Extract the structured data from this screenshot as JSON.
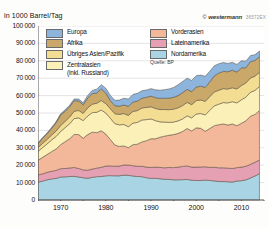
{
  "figure": {
    "axis_title": "in 1000 Barrel/Tag",
    "credit_symbol": "©",
    "credit_name": "westermann",
    "credit_code": "36572EX",
    "source": "Quelle: BP"
  },
  "legend": {
    "column_left": [
      {
        "label": "Europa",
        "color": "#8cb4dc"
      },
      {
        "label": "Afrika",
        "color": "#c9a86a"
      },
      {
        "label": "Übriges Asien/Pazifik",
        "color": "#f2dd92"
      },
      {
        "label": "Zentralasien\n(inkl. Russland)",
        "color": "#fbf0b8"
      }
    ],
    "column_right": [
      {
        "label": "Vorderasien",
        "color": "#f3b79a"
      },
      {
        "label": "Lateinamerika",
        "color": "#e6a0b4"
      },
      {
        "label": "Nordamerika",
        "color": "#a8d4e4"
      }
    ]
  },
  "chart_data": {
    "type": "area",
    "title": "",
    "subtitle": "",
    "xlabel": "",
    "ylabel": "in 1000 Barrel/Tag",
    "xlim": [
      1965,
      2015
    ],
    "ylim": [
      0,
      100000
    ],
    "ytick_step": 10000,
    "yticks": [
      0,
      10000,
      20000,
      30000,
      40000,
      50000,
      60000,
      70000,
      80000,
      90000,
      100000
    ],
    "ytick_labels": [
      "0",
      "10 000",
      "20 000",
      "30 000",
      "40 000",
      "50 000",
      "60 000",
      "70 000",
      "80 000",
      "90 000",
      "100 000"
    ],
    "xticks": [
      1965,
      1970,
      1975,
      1980,
      1985,
      1990,
      1995,
      2000,
      2005,
      2010,
      2015
    ],
    "xtick_labels_shown": [
      "1970",
      "1980",
      "1990",
      "2000",
      "2010"
    ],
    "grid": true,
    "stacked": true,
    "legend_position": "top",
    "x": [
      1965,
      1966,
      1967,
      1968,
      1969,
      1970,
      1971,
      1972,
      1973,
      1974,
      1975,
      1976,
      1977,
      1978,
      1979,
      1980,
      1981,
      1982,
      1983,
      1984,
      1985,
      1986,
      1987,
      1988,
      1989,
      1990,
      1991,
      1992,
      1993,
      1994,
      1995,
      1996,
      1997,
      1998,
      1999,
      2000,
      2001,
      2002,
      2003,
      2004,
      2005,
      2006,
      2007,
      2008,
      2009,
      2010,
      2011,
      2012,
      2013,
      2014
    ],
    "series": [
      {
        "name": "Nordamerika",
        "color": "#a8d4e4",
        "values": [
          10300,
          10800,
          11600,
          12100,
          12400,
          13200,
          13300,
          13500,
          13600,
          13200,
          12800,
          12500,
          13000,
          13400,
          13500,
          13900,
          14000,
          13900,
          13900,
          14300,
          14200,
          13800,
          13500,
          13400,
          12800,
          12400,
          12500,
          12200,
          11900,
          11900,
          11600,
          11600,
          11700,
          11800,
          11400,
          11200,
          11200,
          11500,
          11200,
          11000,
          10600,
          10600,
          10500,
          10300,
          10900,
          11100,
          11600,
          12600,
          13800,
          15100
        ]
      },
      {
        "name": "Lateinamerika",
        "color": "#e6a0b4",
        "values": [
          4100,
          4200,
          4300,
          4400,
          4600,
          4800,
          4800,
          4900,
          5100,
          4900,
          4500,
          4600,
          4800,
          4900,
          5300,
          5600,
          5600,
          5500,
          5600,
          5800,
          5900,
          5900,
          5900,
          6000,
          6100,
          6300,
          6400,
          6500,
          6600,
          6800,
          7000,
          7300,
          7600,
          7800,
          7500,
          7700,
          7800,
          7600,
          7500,
          7800,
          7900,
          7900,
          7800,
          7800,
          7700,
          7800,
          7800,
          7900,
          7900,
          7900
        ]
      },
      {
        "name": "Vorderasien",
        "color": "#f3b79a",
        "values": [
          8400,
          9500,
          10200,
          11300,
          12300,
          13800,
          15400,
          16800,
          19000,
          19500,
          18200,
          20500,
          21200,
          20400,
          21000,
          18400,
          15200,
          12200,
          11300,
          11000,
          10000,
          12100,
          12700,
          14000,
          15200,
          16500,
          16300,
          17400,
          18200,
          18500,
          19000,
          19400,
          20100,
          21500,
          20800,
          22600,
          22200,
          20400,
          22400,
          23900,
          24800,
          25200,
          24800,
          25600,
          24100,
          25200,
          26100,
          27700,
          27500,
          28400
        ]
      },
      {
        "name": "Zentralasien (inkl. Russland)",
        "color": "#fbf0b8",
        "values": [
          5100,
          5600,
          6100,
          6700,
          7200,
          7600,
          8100,
          8600,
          9100,
          9600,
          10100,
          10700,
          11200,
          11700,
          11900,
          12100,
          12200,
          12300,
          12400,
          12300,
          12000,
          12400,
          12500,
          12600,
          12100,
          11400,
          10400,
          8800,
          8100,
          7400,
          7200,
          7200,
          7200,
          7300,
          7500,
          7900,
          8500,
          9400,
          10400,
          11400,
          11800,
          12300,
          12700,
          12800,
          13100,
          13500,
          13600,
          13700,
          13800,
          13800
        ]
      },
      {
        "name": "Übriges Asien/Pazifik",
        "color": "#f2dd92",
        "values": [
          2200,
          2400,
          2600,
          2800,
          3100,
          3400,
          3600,
          3900,
          4200,
          4300,
          4200,
          4600,
          4900,
          5200,
          5500,
          5400,
          5500,
          5700,
          6000,
          6300,
          6500,
          6700,
          6800,
          6900,
          7000,
          7000,
          7000,
          7100,
          7200,
          7300,
          7400,
          7500,
          7700,
          7700,
          7600,
          7700,
          7800,
          7800,
          7900,
          8000,
          8000,
          8000,
          8000,
          8000,
          8000,
          8200,
          8200,
          8200,
          8200,
          8200
        ]
      },
      {
        "name": "Afrika",
        "color": "#c9a86a",
        "values": [
          2300,
          2900,
          3200,
          3800,
          4800,
          6000,
          5800,
          5900,
          6100,
          5400,
          4900,
          5700,
          6000,
          5900,
          6600,
          6100,
          4700,
          4600,
          4700,
          4900,
          5200,
          5400,
          5400,
          5600,
          5800,
          6100,
          6200,
          6400,
          6500,
          6600,
          6800,
          7000,
          7400,
          7500,
          7400,
          7800,
          7900,
          8000,
          8400,
          9200,
          9800,
          9900,
          9900,
          10100,
          9700,
          10100,
          8700,
          9400,
          9000,
          8900
        ]
      },
      {
        "name": "Europa",
        "color": "#8cb4dc",
        "values": [
          400,
          450,
          500,
          560,
          620,
          700,
          800,
          900,
          1000,
          1100,
          1200,
          1500,
          1900,
          2200,
          2500,
          2700,
          2900,
          3100,
          3500,
          3900,
          4200,
          4400,
          4500,
          4300,
          4200,
          4300,
          4500,
          4700,
          4900,
          5300,
          5700,
          6200,
          6400,
          6400,
          6500,
          6500,
          6400,
          6400,
          6200,
          5800,
          5400,
          5100,
          4800,
          4500,
          4400,
          4100,
          3800,
          3500,
          3300,
          3300
        ]
      }
    ]
  }
}
